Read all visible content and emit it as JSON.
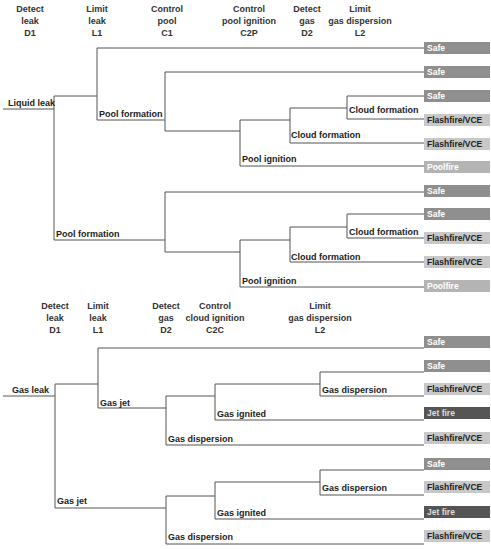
{
  "tree1": {
    "headers": [
      {
        "line1": "Detect",
        "line2": "leak",
        "code": "D1",
        "x": 30
      },
      {
        "line1": "Limit",
        "line2": "leak",
        "code": "L1",
        "x": 97
      },
      {
        "line1": "Control",
        "line2": "pool",
        "code": "C1",
        "x": 167
      },
      {
        "line1": "Control",
        "line2": "pool ignition",
        "code": "C2P",
        "x": 249
      },
      {
        "line1": "Detect",
        "line2": "gas",
        "code": "D2",
        "x": 307
      },
      {
        "line1": "Limit",
        "line2": "gas dispersion",
        "code": "L2",
        "x": 360
      }
    ],
    "initiating_event": "Liquid leak",
    "branch_labels": [
      {
        "text": "Pool formation",
        "x": 99,
        "y": 109
      },
      {
        "text": "Cloud formation",
        "x": 349,
        "y": 105
      },
      {
        "text": "Cloud formation",
        "x": 291,
        "y": 130
      },
      {
        "text": "Pool ignition",
        "x": 242,
        "y": 154
      },
      {
        "text": "Pool formation",
        "x": 56,
        "y": 229
      },
      {
        "text": "Cloud formation",
        "x": 349,
        "y": 227
      },
      {
        "text": "Cloud formation",
        "x": 291,
        "y": 252
      },
      {
        "text": "Pool ignition",
        "x": 242,
        "y": 276
      }
    ],
    "outcomes": [
      {
        "label": "Safe",
        "type": "safe",
        "y": 42
      },
      {
        "label": "Safe",
        "type": "safe",
        "y": 66
      },
      {
        "label": "Safe",
        "type": "safe",
        "y": 90
      },
      {
        "label": "Flashfire/VCE",
        "type": "flash",
        "y": 114
      },
      {
        "label": "Flashfire/VCE",
        "type": "flash",
        "y": 138
      },
      {
        "label": "Poolfire",
        "type": "pool",
        "y": 161
      },
      {
        "label": "Safe",
        "type": "safe",
        "y": 185
      },
      {
        "label": "Safe",
        "type": "safe",
        "y": 208
      },
      {
        "label": "Flashfire/VCE",
        "type": "flash",
        "y": 232
      },
      {
        "label": "Flashfire/VCE",
        "type": "flash",
        "y": 256
      },
      {
        "label": "Poolfire",
        "type": "pool",
        "y": 280
      }
    ]
  },
  "tree2": {
    "headers": [
      {
        "line1": "Detect",
        "line2": "leak",
        "code": "D1",
        "x": 55
      },
      {
        "line1": "Limit",
        "line2": "leak",
        "code": "L1",
        "x": 98
      },
      {
        "line1": "Detect",
        "line2": "gas",
        "code": "D2",
        "x": 166
      },
      {
        "line1": "Control",
        "line2": "cloud ignition",
        "code": "C2C",
        "x": 215
      },
      {
        "line1": "Limit",
        "line2": "gas dispersion",
        "code": "L2",
        "x": 320
      }
    ],
    "initiating_event": "Gas leak",
    "branch_labels": [
      {
        "text": "Gas jet",
        "x": 100,
        "y": 398
      },
      {
        "text": "Gas dispersion",
        "x": 322,
        "y": 385
      },
      {
        "text": "Gas ignited",
        "x": 217,
        "y": 409
      },
      {
        "text": "Gas dispersion",
        "x": 168,
        "y": 434
      },
      {
        "text": "Gas jet",
        "x": 57,
        "y": 496
      },
      {
        "text": "Gas dispersion",
        "x": 322,
        "y": 483
      },
      {
        "text": "Gas ignited",
        "x": 217,
        "y": 508
      },
      {
        "text": "Gas dispersion",
        "x": 168,
        "y": 532
      }
    ],
    "outcomes": [
      {
        "label": "Safe",
        "type": "safe",
        "y": 336
      },
      {
        "label": "Safe",
        "type": "safe",
        "y": 360
      },
      {
        "label": "Flashfire/VCE",
        "type": "flash",
        "y": 383
      },
      {
        "label": "Jet fire",
        "type": "jet",
        "y": 407
      },
      {
        "label": "Flashfire/VCE",
        "type": "flash",
        "y": 432
      },
      {
        "label": "Safe",
        "type": "safe",
        "y": 458
      },
      {
        "label": "Flashfire/VCE",
        "type": "flash",
        "y": 481
      },
      {
        "label": "Jet fire",
        "type": "jet",
        "y": 506
      },
      {
        "label": "Flashfire/VCE",
        "type": "flash",
        "y": 530
      }
    ]
  }
}
